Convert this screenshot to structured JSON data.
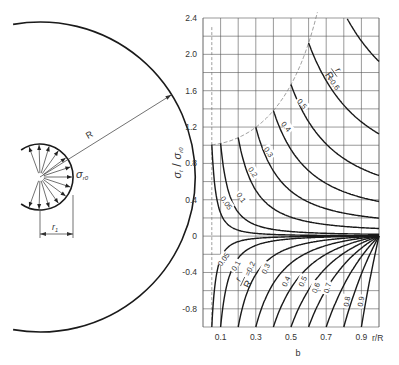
{
  "left_diagram": {
    "center": [
      40,
      177
    ],
    "outer_radius_px": 155,
    "inner_radius_px": 33,
    "outer_radius_label": "R",
    "inner_radius_label": "r",
    "inner_radius_subscript": "1",
    "stress_label": "σ",
    "stress_subscript": "r0",
    "arrow_count": 13
  },
  "chart_data": {
    "type": "line",
    "title": "",
    "xlabel": "r/R",
    "x_sublabel": "b",
    "ylabel": "σt / σr0",
    "ylabel_main": "σ",
    "ylabel_sub_num": "t",
    "ylabel_den": "σ",
    "ylabel_sub_den": "r0",
    "xlim": [
      0,
      1.0
    ],
    "ylim": [
      -1.0,
      2.4
    ],
    "grid": true,
    "x_ticks": [
      "0.1",
      "0.3",
      "0.5",
      "0.7",
      "0.9"
    ],
    "x_tick_values": [
      0.1,
      0.3,
      0.5,
      0.7,
      0.9
    ],
    "y_ticks": [
      "2.4",
      "2.0",
      "1.6",
      "1.2",
      "0.8",
      "0.4",
      "0",
      "-0.4",
      "-0.8"
    ],
    "y_tick_values": [
      2.4,
      2.0,
      1.6,
      1.2,
      0.8,
      0.4,
      0,
      -0.4,
      -0.8
    ],
    "parameter_name": "r1/R",
    "tangential_series": [
      {
        "name": "0.05",
        "k": 0.05
      },
      {
        "name": "0.1",
        "k": 0.1
      },
      {
        "name": "0.2",
        "k": 0.2
      },
      {
        "name": "0.3",
        "k": 0.3
      },
      {
        "name": "0.4",
        "k": 0.4
      },
      {
        "name": "0.5",
        "k": 0.5
      },
      {
        "name": "0.6",
        "k": 0.6
      },
      {
        "name": "0.7",
        "k": 0.7
      }
    ],
    "radial_series": [
      {
        "name": "0.05",
        "k": 0.05
      },
      {
        "name": "0.1",
        "k": 0.1
      },
      {
        "name": "0.2",
        "k": 0.2
      },
      {
        "name": "0.3",
        "k": 0.3
      },
      {
        "name": "0.4",
        "k": 0.4
      },
      {
        "name": "0.5",
        "k": 0.5
      },
      {
        "name": "0.6",
        "k": 0.6
      },
      {
        "name": "0.7",
        "k": 0.7
      },
      {
        "name": "0.8",
        "k": 0.8
      },
      {
        "name": "0.9",
        "k": 0.9
      }
    ],
    "upper_labels": [
      {
        "text": "0.05",
        "x": 0.13,
        "y": 0.36,
        "rot": 55
      },
      {
        "text": "0.1",
        "x": 0.215,
        "y": 0.42,
        "rot": 55
      },
      {
        "text": "0.2",
        "x": 0.28,
        "y": 0.7,
        "rot": 55
      },
      {
        "text": "0.3",
        "x": 0.37,
        "y": 0.92,
        "rot": 55
      },
      {
        "text": "0.4",
        "x": 0.47,
        "y": 1.2,
        "rot": 50
      },
      {
        "text": "0.5",
        "x": 0.56,
        "y": 1.45,
        "rot": 50
      },
      {
        "text": "=0.6",
        "x": 0.74,
        "y": 1.68,
        "rot": 55
      }
    ],
    "lower_labels": [
      {
        "text": "0.05",
        "x": 0.12,
        "y": -0.26,
        "rot": -55
      },
      {
        "text": "0.1",
        "x": 0.19,
        "y": -0.33,
        "rot": -60
      },
      {
        "text": "=0.2",
        "x": 0.27,
        "y": -0.36,
        "rot": -65
      },
      {
        "text": "0.3",
        "x": 0.36,
        "y": -0.36,
        "rot": -65
      },
      {
        "text": "0.4",
        "x": 0.475,
        "y": -0.5,
        "rot": -65
      },
      {
        "text": "0.5",
        "x": 0.57,
        "y": -0.5,
        "rot": -65
      },
      {
        "text": "0.6",
        "x": 0.645,
        "y": -0.57,
        "rot": -70
      },
      {
        "text": "0.7",
        "x": 0.71,
        "y": -0.57,
        "rot": -75
      },
      {
        "text": "0.8",
        "x": 0.82,
        "y": -0.72,
        "rot": -80
      },
      {
        "text": "0.9",
        "x": 0.9,
        "y": -0.72,
        "rot": -80
      }
    ],
    "param_label_upper": {
      "num": "r",
      "sub": "1",
      "den": "R",
      "x": 0.745,
      "y": 1.8
    },
    "param_label_lower": {
      "num": "r",
      "sub": "1",
      "den": "R",
      "x": 0.225,
      "y": -0.5
    }
  },
  "plot_box": {
    "left": 203,
    "right": 379,
    "top": 18,
    "bottom": 327
  },
  "colors": {
    "curve": "#1a1a1a",
    "grid": "#555555",
    "dashed": "#777777",
    "text": "#333333"
  }
}
